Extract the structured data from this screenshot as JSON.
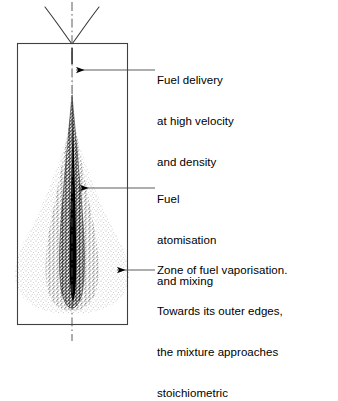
{
  "figure": {
    "background_color": "#ffffff",
    "line_color": "#000000",
    "stipple_dense_color": "#1a1a1a",
    "stipple_light_color": "#8a8a8a"
  },
  "chamber": {
    "name": "combustion chamber outline",
    "shape": "rectangle",
    "x": 17,
    "y": 43,
    "width": 111,
    "height": 282
  },
  "injector": {
    "name": "injector nozzle",
    "tip_x": 72,
    "tip_y": 43,
    "left_wall_start_x": 45,
    "right_wall_end_x": 100,
    "top_y": 6
  },
  "centerline": {
    "name": "axis centreline",
    "style": "dash-dot",
    "x": 72,
    "top_y": 2,
    "bottom_y": 341
  },
  "spray": {
    "core": {
      "name": "dense liquid core",
      "description": "solid black narrow jet",
      "top_y": 50,
      "bottom_y": 300,
      "max_width": 9
    },
    "dense_cloud": {
      "name": "dense atomisation stipple",
      "description": "coarse dark stipple around the core",
      "top_y": 95,
      "bottom_y": 310
    },
    "outer_cloud": {
      "name": "fuel vapour cloud",
      "description": "fine light stipple spreading outwards",
      "top_y": 120,
      "bottom_y": 313,
      "max_half_width": 56
    }
  },
  "annotations": [
    {
      "id": "delivery",
      "name": "fuel-delivery-annotation",
      "lines": [
        "Fuel delivery",
        "at high velocity",
        "and density"
      ],
      "arrow": {
        "tail_x": 155,
        "tail_y": 70,
        "tip_x": 74,
        "tip_y": 70,
        "direction": "left"
      }
    },
    {
      "id": "atomisation",
      "name": "fuel-atomisation-annotation",
      "lines": [
        "Fuel",
        "atomisation",
        "and mixing"
      ],
      "arrow": {
        "tail_x": 155,
        "tail_y": 188,
        "tip_x": 78,
        "tip_y": 188,
        "direction": "left"
      }
    },
    {
      "id": "vaporisation",
      "name": "fuel-vaporisation-annotation",
      "lines": [
        "Zone of fuel vaporisation.",
        "Towards its outer edges,",
        "the mixture approaches",
        "stoichiometric"
      ],
      "arrow": {
        "tail_x": 155,
        "tail_y": 270,
        "tip_x": 115,
        "tip_y": 270,
        "direction": "left"
      }
    }
  ]
}
